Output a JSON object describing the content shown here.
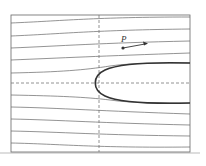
{
  "diagram": {
    "type": "streamline-flow-past-half-body",
    "point_label": "P",
    "colors": {
      "frame": "#666666",
      "streamline": "#666666",
      "body": "#333333",
      "dashed": "#777777",
      "baseline": "#bbbbbb"
    },
    "frame": {
      "x": 11,
      "y": 15,
      "width": 179,
      "height": 137
    },
    "axes": {
      "vertical_dashed_x": 99,
      "horizontal_dashed_y": 83
    },
    "streamlines": [
      "M11 23 C60 21, 95 17, 190 17",
      "M11 36 C60 34, 95 30, 190 29",
      "M11 48 C60 46, 100 43, 190 41",
      "M11 60 C60 58, 100 56, 190 53",
      "M11 73 C60 72, 85 70, 110 66 C130 63, 160 63, 190 63",
      "M11 95 C60 96, 85 97, 110 100 C130 103, 160 103, 190 103",
      "M11 107 C60 108, 100 111, 190 114",
      "M11 119 C60 120, 100 123, 190 125",
      "M11 131 C60 132, 100 135, 190 136",
      "M11 143 C60 144, 95 148, 190 147"
    ],
    "body_path": "M190 63 C150 62, 120 63, 105 70 C92 76, 92 90, 105 96 C120 103, 150 104, 190 103",
    "point": {
      "x": 123,
      "y": 48
    },
    "arrow_end": {
      "x": 145,
      "y": 44
    }
  }
}
